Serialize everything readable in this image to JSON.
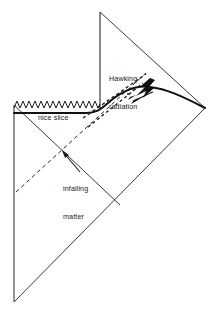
{
  "figure": {
    "kind": "penrose-diagram",
    "background_color": "#ffffff",
    "line_color": "#3a3a3a",
    "bold_line_color": "#111111",
    "text_color": "#1a1a1a"
  },
  "labels": {
    "hawking_line1": "Hawking",
    "hawking_line2": "radiation",
    "nice_slice": "nice slice",
    "infalling_line1": "infalling",
    "infalling_line2": "matter"
  },
  "elements": {
    "singularity": "zigzag-singularity-line",
    "horizon_vertical": "vertical-inner-boundary",
    "event_horizon_dashed": "dashed-event-horizon",
    "secondary_dashed": "dashed-secondary-ray",
    "nice_slice_curve": "bold-nice-slice-curve",
    "infalling_dashed": "dashed-infalling-matter-ray",
    "hawking_burst": "lightning-burst-icon",
    "infalling_arrow": "arrow-icon",
    "left_boundary": "left-vertical-boundary",
    "null_infinity": "diagonal-null-infinity",
    "past_null": "diagonal-past-null-boundary"
  },
  "geometry": {
    "apex": [
      100,
      12
    ],
    "right_corner": [
      205,
      108
    ],
    "bottom_vertex": [
      14,
      302
    ],
    "left_top": [
      14,
      105
    ],
    "singularity_span_x": [
      14,
      100
    ],
    "singularity_y": 105,
    "nice_slice_y": 113
  }
}
